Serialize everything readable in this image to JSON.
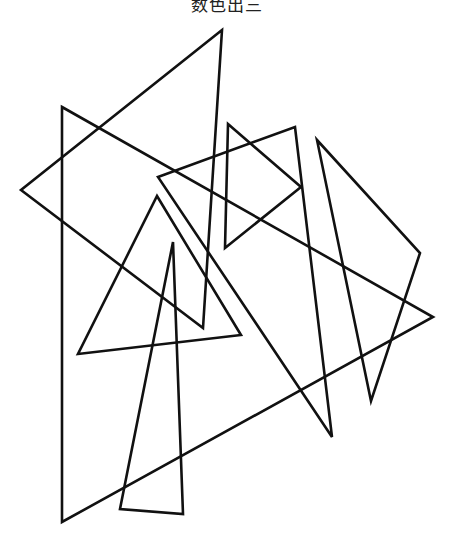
{
  "title": "数色出三",
  "figure": {
    "stroke_color": "#111111",
    "stroke_width": 2.6,
    "background": "#ffffff",
    "triangles": [
      {
        "id": "A",
        "points": "222,30 21,190 203,328"
      },
      {
        "id": "B",
        "points": "62,107 433,317 62,522"
      },
      {
        "id": "C",
        "points": "228,124 301,187 225,248"
      },
      {
        "id": "D",
        "points": "158,177 295,127 332,437"
      },
      {
        "id": "E",
        "points": "317,140 420,253 371,401"
      },
      {
        "id": "F",
        "points": "157,196 241,335 78,354"
      },
      {
        "id": "G",
        "points": "173,242 183,514 120,509"
      }
    ]
  }
}
